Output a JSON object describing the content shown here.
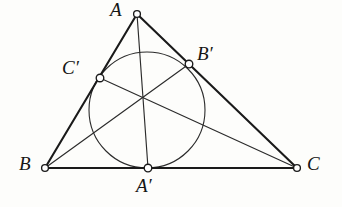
{
  "figure": {
    "background_color": "#fdfdfb",
    "stroke_color": "#1a1a1a",
    "canvas": {
      "width": 342,
      "height": 207
    }
  },
  "labels": {
    "A": "A",
    "B": "B",
    "C": "C",
    "A_prime": "A′",
    "B_prime": "B′",
    "C_prime": "C′"
  },
  "geometry": {
    "points": [
      {
        "name": "A",
        "label": "A",
        "x": 137,
        "y": 14,
        "marker_r": 3.4,
        "label_x": 110,
        "label_y": 0
      },
      {
        "name": "B",
        "label": "B",
        "x": 45,
        "y": 168,
        "marker_r": 3.4,
        "label_x": 19,
        "label_y": 154
      },
      {
        "name": "C",
        "label": "C",
        "x": 297,
        "y": 168,
        "marker_r": 3.4,
        "label_x": 307,
        "label_y": 154
      },
      {
        "name": "A'",
        "label": "A′",
        "x": 148,
        "y": 168,
        "marker_r": 3.8,
        "label_x": 136,
        "label_y": 176
      },
      {
        "name": "B'",
        "label": "B′",
        "x": 189,
        "y": 64,
        "marker_r": 3.8,
        "label_x": 197,
        "label_y": 44
      },
      {
        "name": "C'",
        "label": "C′",
        "x": 100,
        "y": 78,
        "marker_r": 3.8,
        "label_x": 62,
        "label_y": 58
      }
    ],
    "incircle": {
      "cx": 147,
      "cy": 110,
      "r": 58
    },
    "gergonne_point": {
      "x": 147,
      "y": 103
    },
    "sides": [
      {
        "name": "side-AB",
        "x1": 137,
        "y1": 14,
        "x2": 45,
        "y2": 168
      },
      {
        "name": "side-AC",
        "x1": 137,
        "y1": 14,
        "x2": 297,
        "y2": 168
      },
      {
        "name": "side-BC",
        "x1": 45,
        "y1": 168,
        "x2": 297,
        "y2": 168
      }
    ],
    "cevians": [
      {
        "name": "cevian-A-to-A'",
        "x1": 137,
        "y1": 14,
        "x2": 148,
        "y2": 168
      },
      {
        "name": "cevian-B-to-B'",
        "x1": 45,
        "y1": 168,
        "x2": 189,
        "y2": 64
      },
      {
        "name": "cevian-C-to-C'",
        "x1": 297,
        "y1": 168,
        "x2": 100,
        "y2": 78
      }
    ]
  }
}
